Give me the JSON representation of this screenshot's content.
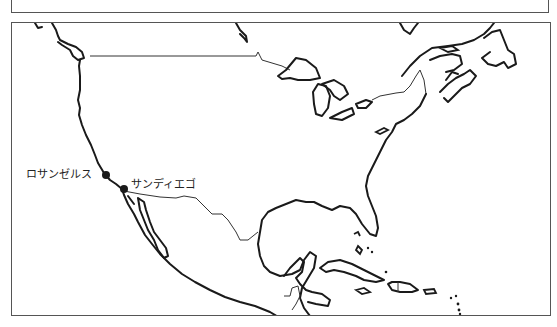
{
  "map": {
    "region": "North America",
    "cities": [
      {
        "name": "ロサンゼルス",
        "x": 106,
        "y": 175
      },
      {
        "name": "サンディエゴ",
        "x": 124,
        "y": 189
      }
    ],
    "colors": {
      "line": "#1a1a1a",
      "frame": "#555555",
      "background": "#ffffff"
    }
  }
}
